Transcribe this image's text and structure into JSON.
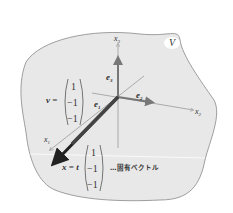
{
  "diagram": {
    "space_label": "V",
    "axes": {
      "x1": "x",
      "x1_sub": "1",
      "x2": "x",
      "x2_sub": "2",
      "x3": "x",
      "x3_sub": "3"
    },
    "basis": {
      "e1": "e",
      "e1_sub": "1",
      "e2": "e",
      "e2_sub": "2",
      "e3": "e",
      "e3_sub": "3"
    },
    "vector_v": {
      "label": "v =",
      "components": [
        "1",
        "−1",
        "−1"
      ]
    },
    "vector_x": {
      "label": "x = t",
      "components": [
        "1",
        "−1",
        "−1"
      ]
    },
    "annotation": "…固有ベクトル",
    "colors": {
      "region_fill": "#e8e8e8",
      "region_stroke": "#888888",
      "arrow_dark": "#222222",
      "arrow_mid": "#777777",
      "axis_line": "#999999"
    }
  }
}
